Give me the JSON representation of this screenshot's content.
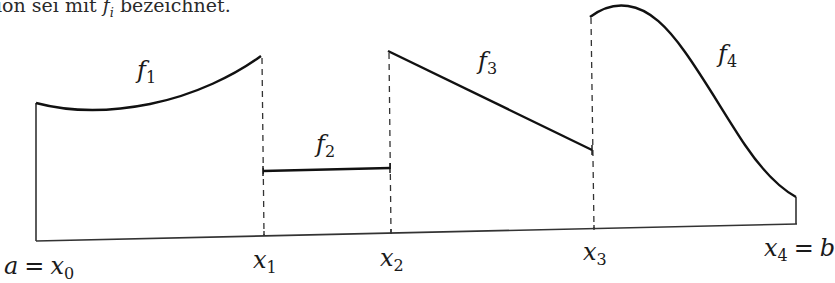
{
  "caption": {
    "prefix": "ion sei mit ",
    "symbol": "f",
    "subscript": "i",
    "suffix": " bezeichnet."
  },
  "figure": {
    "stroke_color": "#111111",
    "dash_color": "#333333",
    "nodes": [
      {
        "id": "x0",
        "base": "x",
        "sub": "0",
        "prefix": "a",
        "eq": "=",
        "x": 37
      },
      {
        "id": "x1",
        "base": "x",
        "sub": "1",
        "x": 264
      },
      {
        "id": "x2",
        "base": "x",
        "sub": "2",
        "x": 391
      },
      {
        "id": "x3",
        "base": "x",
        "sub": "3",
        "x": 594
      },
      {
        "id": "x4",
        "base": "x",
        "sub": "4",
        "suffix": "b",
        "eq": "=",
        "x": 796
      }
    ],
    "functions": [
      {
        "name": "f",
        "sub": "1",
        "shape": "convex curve rising"
      },
      {
        "name": "f",
        "sub": "2",
        "shape": "constant"
      },
      {
        "name": "f",
        "sub": "3",
        "shape": "linear decreasing"
      },
      {
        "name": "f",
        "sub": "4",
        "shape": "hump then decreasing"
      }
    ]
  }
}
